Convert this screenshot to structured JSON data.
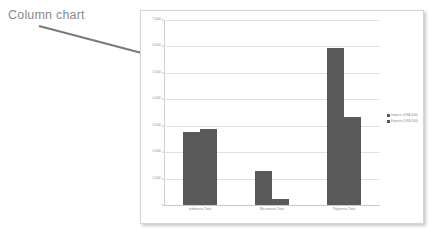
{
  "annotation": {
    "label": "Column chart",
    "arrow_color": "#7a7a7a",
    "label_color": "#8a8a8a"
  },
  "chart_data": {
    "type": "bar",
    "title": "",
    "xlabel": "",
    "ylabel": "",
    "categories": [
      "Indonesia Total",
      "Micronesia Total",
      "Polynesia Total"
    ],
    "series": [
      {
        "name": "Imports (US$,000)",
        "values": [
          2780,
          1300,
          5930
        ]
      },
      {
        "name": "Exports (US$,000)",
        "values": [
          2870,
          210,
          3330
        ]
      }
    ],
    "ylim": [
      0,
      7000
    ],
    "yticks": [
      0,
      1000,
      2000,
      3000,
      4000,
      5000,
      6000,
      7000
    ],
    "ytick_labels": [
      "-",
      "1,000",
      "2,000",
      "3,000",
      "4,000",
      "5,000",
      "6,000",
      "7,000"
    ],
    "grid": true,
    "legend_position": "right",
    "bar_color": "#595959",
    "gridline_color": "#e2e2e2",
    "plot_background": "#ffffff"
  }
}
